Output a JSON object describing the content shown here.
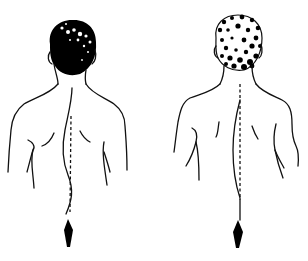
{
  "illustration": {
    "figures": [
      {
        "id": "left",
        "label": "curved-spine figure",
        "hair": "dark",
        "spine": "curved",
        "plumb_line": "dashed",
        "weight": "diamond"
      },
      {
        "id": "right",
        "label": "straight-spine figure",
        "hair": "light-curly",
        "spine": "straight",
        "plumb_line": "dashed",
        "weight": "diamond"
      }
    ],
    "colors": {
      "line": "#111111",
      "fill": "#000000",
      "background": "#ffffff"
    }
  }
}
